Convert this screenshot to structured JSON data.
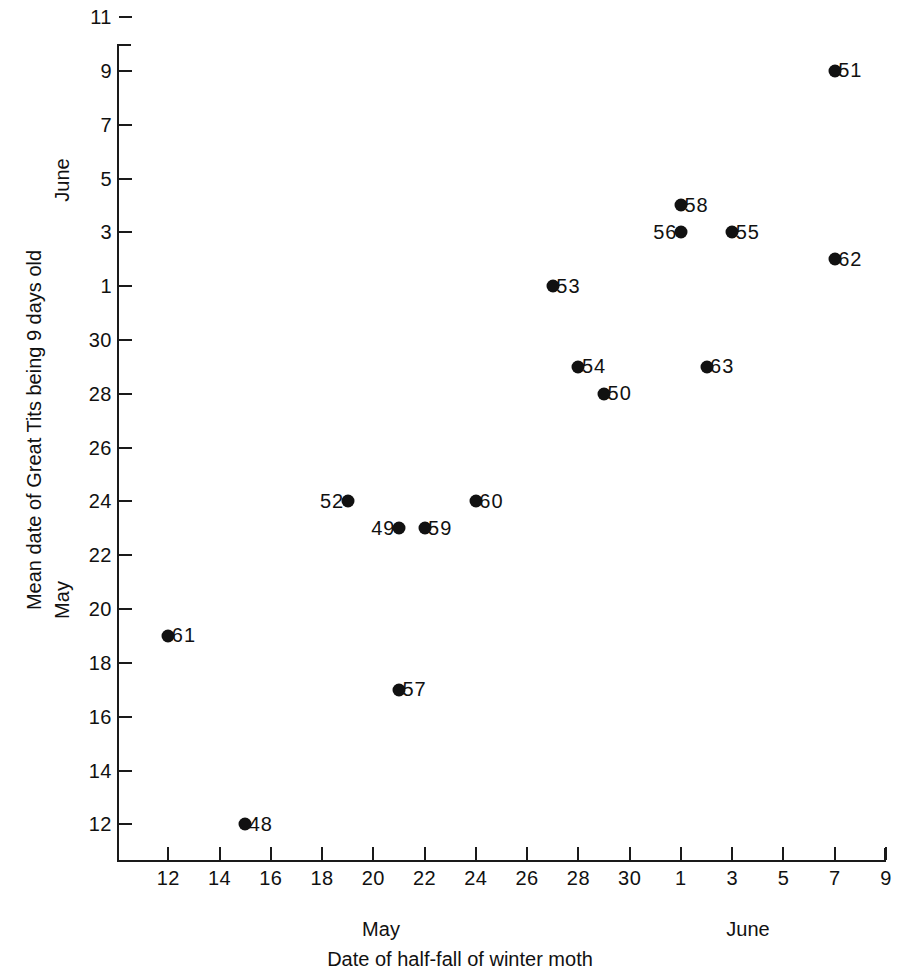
{
  "chart_data": {
    "type": "scatter",
    "title": "",
    "xlabel": "Date of half-fall of winter moth",
    "ylabel": "Mean date of Great Tits being 9 days old",
    "x_month_labels": [
      "May",
      "June"
    ],
    "y_month_labels": [
      "May",
      "June"
    ],
    "grid": false,
    "legend": null,
    "xlim": [
      10.0,
      40.0
    ],
    "ylim": [
      10.6,
      41.0
    ],
    "x_tick_labels": [
      "12",
      "14",
      "16",
      "18",
      "20",
      "22",
      "24",
      "26",
      "28",
      "30",
      "1",
      "3",
      "5",
      "7",
      "9"
    ],
    "x_tick_values": [
      12,
      14,
      16,
      18,
      20,
      22,
      24,
      26,
      28,
      30,
      32,
      34,
      36,
      38,
      40
    ],
    "y_tick_labels": [
      "12",
      "14",
      "16",
      "18",
      "20",
      "22",
      "24",
      "26",
      "28",
      "30",
      "1",
      "3",
      "5",
      "7",
      "9",
      "11"
    ],
    "y_tick_values": [
      12,
      14,
      16,
      18,
      20,
      22,
      24,
      26,
      28,
      30,
      32,
      34,
      36,
      38,
      40,
      42
    ],
    "note": "x and y are days; values >31 are June dates encoded as 31 + day-of-June",
    "points": [
      {
        "label": "61",
        "x": 12,
        "y": 19,
        "label_side": "right",
        "x_date": "May 12",
        "y_date": "May 19"
      },
      {
        "label": "48",
        "x": 15,
        "y": 12,
        "label_side": "right",
        "x_date": "May 15",
        "y_date": "May 12"
      },
      {
        "label": "52",
        "x": 19,
        "y": 24,
        "label_side": "left",
        "x_date": "May 19",
        "y_date": "May 24"
      },
      {
        "label": "57",
        "x": 21,
        "y": 17,
        "label_side": "right",
        "x_date": "May 21",
        "y_date": "May 17"
      },
      {
        "label": "49",
        "x": 21,
        "y": 23,
        "label_side": "left",
        "x_date": "May 21",
        "y_date": "May 23"
      },
      {
        "label": "59",
        "x": 22,
        "y": 23,
        "label_side": "right",
        "x_date": "May 22",
        "y_date": "May 23"
      },
      {
        "label": "60",
        "x": 24,
        "y": 24,
        "label_side": "right",
        "x_date": "May 24",
        "y_date": "May 24"
      },
      {
        "label": "53",
        "x": 27,
        "y": 32,
        "label_side": "right",
        "x_date": "May 27",
        "y_date": "June 1"
      },
      {
        "label": "54",
        "x": 28,
        "y": 29,
        "label_side": "right",
        "x_date": "May 28",
        "y_date": "May 29"
      },
      {
        "label": "50",
        "x": 29,
        "y": 28,
        "label_side": "right",
        "x_date": "May 29",
        "y_date": "May 28"
      },
      {
        "label": "63",
        "x": 33,
        "y": 29,
        "label_side": "right",
        "x_date": "June 2",
        "y_date": "May 29"
      },
      {
        "label": "56",
        "x": 32,
        "y": 34,
        "label_side": "left",
        "x_date": "June 1",
        "y_date": "June 3"
      },
      {
        "label": "58",
        "x": 32,
        "y": 35,
        "label_side": "right",
        "x_date": "June 1",
        "y_date": "June 4"
      },
      {
        "label": "55",
        "x": 34,
        "y": 34,
        "label_side": "right",
        "x_date": "June 3",
        "y_date": "June 3"
      },
      {
        "label": "62",
        "x": 38,
        "y": 33,
        "label_side": "right",
        "x_date": "June 7",
        "y_date": "June 2"
      },
      {
        "label": "51",
        "x": 38,
        "y": 40,
        "label_side": "right",
        "x_date": "June 7",
        "y_date": "June 9"
      }
    ]
  },
  "colors": {
    "marker": "#111111",
    "axis": "#1a1a1a",
    "background": "#ffffff",
    "text": "#111111"
  }
}
